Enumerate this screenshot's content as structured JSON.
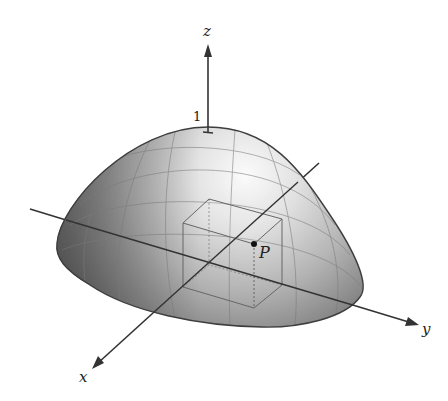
{
  "figure": {
    "labels": {
      "z_axis": "z",
      "x_axis": "x",
      "y_axis": "y",
      "z_intercept": "1",
      "point": "P"
    },
    "colors": {
      "axis": "#333333",
      "surface_dark": "#5e5e5e",
      "surface_mid": "#a8a8a8",
      "surface_light": "#f4f4f4",
      "grid": "#7a7a7a",
      "box_edge": "#666666",
      "point": "#111111"
    }
  }
}
